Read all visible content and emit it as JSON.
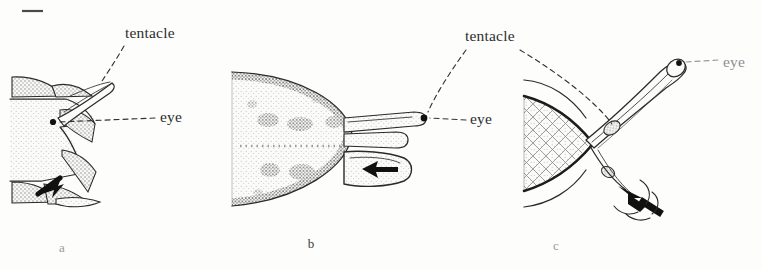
{
  "figure": {
    "kind": "scientific-illustration",
    "background_color": "#fdfdfc",
    "ink_color": "#2a2a2a",
    "scale_bar": {
      "name": "scale-bar",
      "x": 22,
      "y": 11,
      "length": 21
    }
  },
  "labels": [
    {
      "id": "tentacle-a",
      "text": "tentacle",
      "x": 125,
      "y": 38,
      "faint": false
    },
    {
      "id": "eye-a",
      "text": "eye",
      "x": 160,
      "y": 122,
      "faint": false
    },
    {
      "id": "tentacle-bc",
      "text": "tentacle",
      "x": 465,
      "y": 41,
      "faint": false
    },
    {
      "id": "eye-b",
      "text": "eye",
      "x": 470,
      "y": 124,
      "faint": false
    },
    {
      "id": "eye-c",
      "text": "eye",
      "x": 723,
      "y": 67,
      "faint": true
    }
  ],
  "panels": [
    {
      "id": "a",
      "letter": "a",
      "letter_x": 62,
      "letter_y": 252,
      "faint_letter": true,
      "caption_parts": [
        "tentacle",
        "eye"
      ]
    },
    {
      "id": "b",
      "letter": "b",
      "letter_x": 311,
      "letter_y": 248,
      "faint_letter": false,
      "caption_parts": [
        "tentacle",
        "eye"
      ]
    },
    {
      "id": "c",
      "letter": "c",
      "letter_x": 556,
      "letter_y": 250,
      "faint_letter": true,
      "caption_parts": [
        "tentacle",
        "eye"
      ]
    }
  ],
  "annotations": {
    "arrow_marks": [
      {
        "id": "arrow-a",
        "panel": "a",
        "x": 50,
        "y": 186,
        "direction": "up-right"
      },
      {
        "id": "arrow-b",
        "panel": "b",
        "x": 390,
        "y": 168,
        "direction": "left"
      },
      {
        "id": "arrow-c",
        "panel": "c",
        "x": 633,
        "y": 196,
        "direction": "up-left"
      }
    ],
    "eye_spots": [
      {
        "id": "eye-dot-a",
        "panel": "a",
        "x": 53,
        "y": 122
      },
      {
        "id": "eye-dot-b",
        "panel": "b",
        "x": 424,
        "y": 117
      },
      {
        "id": "eye-dot-c",
        "panel": "c",
        "x": 676,
        "y": 65
      }
    ]
  }
}
